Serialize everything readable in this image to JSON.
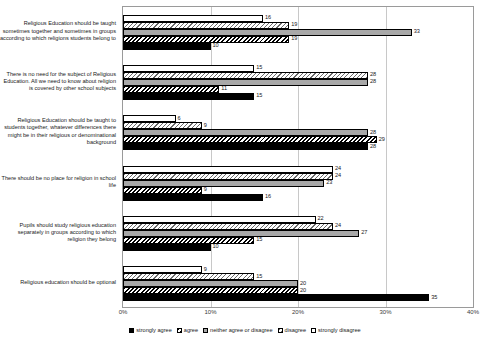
{
  "chart_data": {
    "type": "bar",
    "orientation": "horizontal",
    "title": "",
    "xlabel": "",
    "ylabel": "",
    "xlim": [
      0,
      40
    ],
    "xticks": [
      0,
      10,
      20,
      30,
      40
    ],
    "xtick_labels": [
      "0%",
      "10%",
      "20%",
      "30%",
      "40%"
    ],
    "grid": true,
    "legend_position": "bottom",
    "categories": [
      "Religious Education should be taught sometimes together and sometimes in groups according to which religions students belong to",
      "There is no need for the subject of Religious Education. All we need to know about religion is covered by other school subjects",
      "Religious Education should be taught to students together, whatever differences there might be in their religious or denominational background",
      "There should be no place for religion in school life",
      "Pupils should study religious education separately in groups according to which religion they belong",
      "Religious education should be optional"
    ],
    "series": [
      {
        "name": "strongly agree",
        "color": "#000000",
        "pattern": "solid-black",
        "values": [
          10,
          15,
          28,
          16,
          10,
          35
        ]
      },
      {
        "name": "agree",
        "color": "#000000",
        "pattern": "dark-diagonal-hatch",
        "values": [
          19,
          11,
          29,
          9,
          15,
          20
        ]
      },
      {
        "name": "neither agree or disagree",
        "color": "#a8a8a8",
        "pattern": "solid-gray",
        "values": [
          33,
          28,
          28,
          23,
          27,
          20
        ]
      },
      {
        "name": "disagree",
        "color": "#6a6a6a",
        "pattern": "light-diagonal-hatch",
        "values": [
          19,
          28,
          9,
          24,
          24,
          15
        ]
      },
      {
        "name": "strongly disagree",
        "color": "#ffffff",
        "pattern": "white",
        "values": [
          16,
          15,
          6,
          24,
          22,
          9
        ]
      }
    ]
  }
}
